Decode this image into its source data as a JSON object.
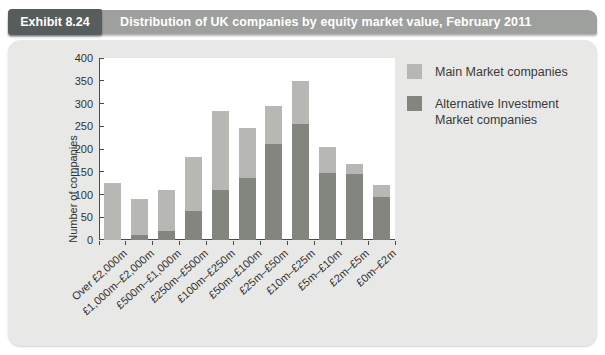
{
  "header": {
    "exhibit_label": "Exhibit 8.24",
    "title": "Distribution of UK companies by equity market value, February 2011",
    "box_color": "#575c5c",
    "bar_color": "#9da09d",
    "text_color": "#ffffff"
  },
  "panel": {
    "background": "#e8e9e6"
  },
  "legend": {
    "items": [
      {
        "label": "Main Market companies",
        "color": "#b7b8b4"
      },
      {
        "label": "Alternative Investment Market companies",
        "color": "#83857f"
      }
    ]
  },
  "chart_data": {
    "type": "bar",
    "stacked": true,
    "title": "Distribution of UK companies by equity market value, February 2011",
    "xlabel": "",
    "ylabel": "Number of companies",
    "ylim": [
      0,
      400
    ],
    "ytick_step": 50,
    "yticks": [
      0,
      50,
      100,
      150,
      200,
      250,
      300,
      350,
      400
    ],
    "grid": false,
    "legend_position": "top-right",
    "categories": [
      "Over £2,000m",
      "£1,000m–£2,000m",
      "£500m–£1,000m",
      "£250m–£500m",
      "£100m–£250m",
      "£50m–£100m",
      "£25m–£50m",
      "£10m–£25m",
      "£5m–£10m",
      "£2m–£5m",
      "£0m–£2m"
    ],
    "series": [
      {
        "name": "Alternative Investment Market companies",
        "color": "#83857f",
        "stack_position": "bottom",
        "values": [
          0,
          12,
          20,
          63,
          110,
          137,
          212,
          255,
          147,
          145,
          95
        ]
      },
      {
        "name": "Main Market companies",
        "color": "#b7b8b4",
        "stack_position": "top",
        "values": [
          125,
          78,
          90,
          119,
          173,
          110,
          83,
          95,
          58,
          21,
          27
        ]
      }
    ],
    "stacked_totals": [
      125,
      90,
      110,
      182,
      283,
      247,
      295,
      350,
      205,
      166,
      122
    ]
  }
}
